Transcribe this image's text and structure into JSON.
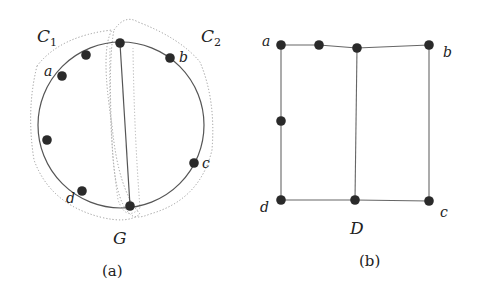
{
  "figure_a": {
    "caption": "(a)",
    "graph_label": "G",
    "cluster_labels": {
      "c1": "C",
      "c1_sub": "1",
      "c2": "C",
      "c2_sub": "2"
    },
    "vertex_labels": {
      "a": "a",
      "b": "b",
      "c": "c",
      "d": "d"
    },
    "nodes": [
      {
        "id": "top",
        "x": 120,
        "y": 43
      },
      {
        "id": "n1",
        "x": 86,
        "y": 55
      },
      {
        "id": "a",
        "x": 62,
        "y": 76
      },
      {
        "id": "left",
        "x": 47,
        "y": 140
      },
      {
        "id": "d",
        "x": 82,
        "y": 191
      },
      {
        "id": "bottom",
        "x": 130,
        "y": 206
      },
      {
        "id": "c",
        "x": 194,
        "y": 163
      },
      {
        "id": "b",
        "x": 170,
        "y": 58
      }
    ],
    "edges": [
      [
        "top",
        "bottom"
      ]
    ],
    "circle": {
      "cx": 121,
      "cy": 125,
      "r": 83
    }
  },
  "figure_b": {
    "caption": "(b)",
    "graph_label": "D",
    "vertex_labels": {
      "a": "a",
      "b": "b",
      "c": "c",
      "d": "d"
    },
    "nodes": [
      {
        "id": "a",
        "x": 281,
        "y": 45
      },
      {
        "id": "n1",
        "x": 319,
        "y": 45
      },
      {
        "id": "n2",
        "x": 357,
        "y": 48
      },
      {
        "id": "b",
        "x": 429,
        "y": 45
      },
      {
        "id": "left",
        "x": 281,
        "y": 121
      },
      {
        "id": "d",
        "x": 281,
        "y": 200
      },
      {
        "id": "n3",
        "x": 355,
        "y": 200
      },
      {
        "id": "c",
        "x": 429,
        "y": 201
      }
    ],
    "edges": [
      [
        "a",
        "n1"
      ],
      [
        "n1",
        "n2"
      ],
      [
        "n2",
        "b"
      ],
      [
        "a",
        "left"
      ],
      [
        "left",
        "d"
      ],
      [
        "d",
        "n3"
      ],
      [
        "n3",
        "c"
      ],
      [
        "b",
        "c"
      ],
      [
        "n2",
        "n3"
      ]
    ]
  },
  "colors": {
    "node": "#2a2a2a",
    "edge": "#555555",
    "cluster": "#9a9a9a"
  }
}
